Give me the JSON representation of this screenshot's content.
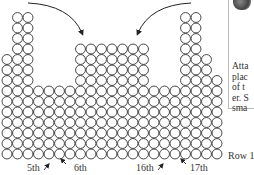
{
  "diagram": {
    "columns": 21,
    "pitch": 10.5,
    "column_heights": [
      10,
      14,
      14,
      7,
      7,
      7,
      7,
      11,
      11,
      11,
      11,
      11,
      11,
      11,
      7,
      7,
      7,
      14,
      14,
      10,
      8
    ],
    "arrows": [
      {
        "from": "top-left",
        "to": "middle-block-left-top"
      },
      {
        "from": "top-right",
        "to": "middle-block-left-top-right"
      }
    ]
  },
  "labels": {
    "fifth": "5th",
    "sixth": "6th",
    "sixteenth": "16th",
    "seventeenth": "17th",
    "row1": "Row 1"
  },
  "sidebar": {
    "lines": [
      "Atta",
      "plac",
      "of t",
      "er. S",
      "sma"
    ]
  },
  "colors": {
    "stroke": "#333333",
    "background": "#ffffff"
  }
}
